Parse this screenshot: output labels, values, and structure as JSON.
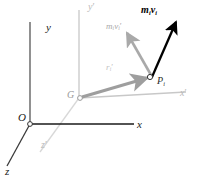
{
  "figure": {
    "type": "vector-diagram",
    "width": 198,
    "height": 185,
    "background": "#ffffff"
  },
  "colors": {
    "axis_fixed": "#1a1a1a",
    "axis_moving": "#c8c8c8",
    "vector_relative": "#a9a9a9",
    "vector_absolute": "#000000",
    "position_vector": "#9e9e9e",
    "marker_stroke": "#333333"
  },
  "axes": {
    "fixed_frame": {
      "origin_label": "O",
      "items": [
        {
          "name": "y-axis",
          "label": "y",
          "prime": false
        },
        {
          "name": "x-axis",
          "label": "x",
          "prime": false
        },
        {
          "name": "z-axis",
          "label": "z",
          "prime": false
        }
      ]
    },
    "moving_frame": {
      "origin_label": "G",
      "items": [
        {
          "name": "y-prime-axis",
          "label": "y",
          "prime": true
        },
        {
          "name": "x-prime-axis",
          "label": "x",
          "prime": true
        },
        {
          "name": "z-prime-axis",
          "label": "z",
          "prime": true
        }
      ]
    }
  },
  "points": [
    {
      "name": "origin",
      "label": "O",
      "x": 30,
      "y": 124
    },
    {
      "name": "mass-center",
      "label": "G",
      "x": 79,
      "y": 98
    },
    {
      "name": "particle",
      "label": "P",
      "sub": "i",
      "x": 152,
      "y": 76
    }
  ],
  "vectors": [
    {
      "name": "position-vector-r-prime",
      "label": "r",
      "sub": "i",
      "prime": true,
      "bold": false,
      "color": "#9e9e9e",
      "from": "G",
      "to": "P_i"
    },
    {
      "name": "relative-momentum-vector",
      "label": "m",
      "sub": "i",
      "label2": "v",
      "sub2": "i",
      "prime": true,
      "bold": false,
      "color": "#a9a9a9",
      "from": "P_i"
    },
    {
      "name": "absolute-momentum-vector",
      "label": "m",
      "sub": "i",
      "label2": "v",
      "sub2": "i",
      "prime": false,
      "bold": true,
      "color": "#000000",
      "from": "P_i"
    }
  ],
  "labels": {
    "y": "y",
    "x": "x",
    "z": "z",
    "y_prime": "y",
    "x_prime": "x",
    "z_prime": "z",
    "prime_mark": "′",
    "O": "O",
    "G": "G",
    "P": "P",
    "i": "i",
    "r": "r",
    "m": "m",
    "v": "v"
  }
}
